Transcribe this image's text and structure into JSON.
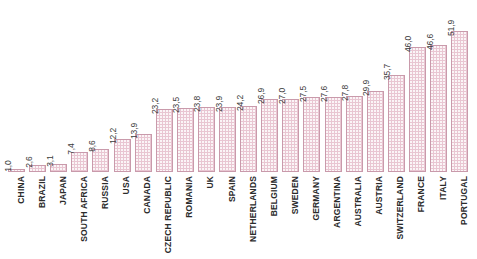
{
  "chart_data": {
    "type": "bar",
    "title": "",
    "subtitle": "",
    "xlabel": "",
    "ylabel": "",
    "ylim": [
      0,
      51.9
    ],
    "grid": false,
    "legend": "none",
    "decimal_separator": ",",
    "orientation": "vertical",
    "label_rotation": "90",
    "categories": [
      "CHINA",
      "BRAZIL",
      "JAPAN",
      "SOUTH AFRICA",
      "RUSSIA",
      "USA",
      "CANADA",
      "CZECH REPUBLIC",
      "ROMANIA",
      "UK",
      "SPAIN",
      "NETHERLANDS",
      "BELGIUM",
      "SWEDEN",
      "GERMANY",
      "ARGENTINA",
      "AUSTRALIA",
      "AUSTRIA",
      "SWITZERLAND",
      "FRANCE",
      "ITALY",
      "PORTUGAL"
    ],
    "values": [
      1.0,
      2.6,
      3.1,
      7.4,
      8.6,
      12.2,
      13.9,
      23.2,
      23.5,
      23.8,
      23.9,
      24.2,
      26.9,
      27.0,
      27.5,
      27.6,
      27.8,
      29.9,
      35.7,
      46.0,
      46.6,
      51.9
    ],
    "value_labels": [
      "1,0",
      "2,6",
      "3,1",
      "7,4",
      "8,6",
      "12,2",
      "13,9",
      "23,2",
      "23,5",
      "23,8",
      "23,9",
      "24,2",
      "26,9",
      "27,0",
      "27,5",
      "27,6",
      "27,8",
      "29,9",
      "35,7",
      "46,0",
      "46,6",
      "51,9"
    ],
    "colors": {
      "bar_fill": "#e9c6d2",
      "bar_border": "#c99aab",
      "background": "#ffffff",
      "value_text": "#3b3b3b",
      "category_text": "#2b2b2b"
    }
  }
}
